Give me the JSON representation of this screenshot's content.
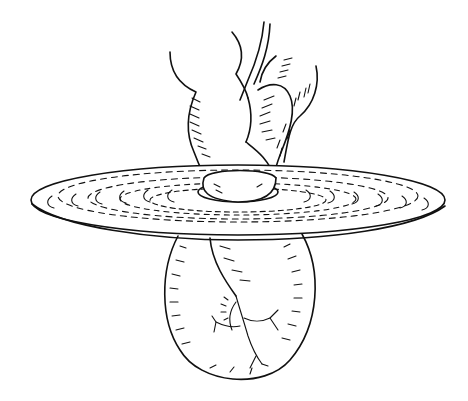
{
  "figure": {
    "kind": "line-drawing",
    "background": "#ffffff",
    "ink": "#111111",
    "labels": []
  }
}
